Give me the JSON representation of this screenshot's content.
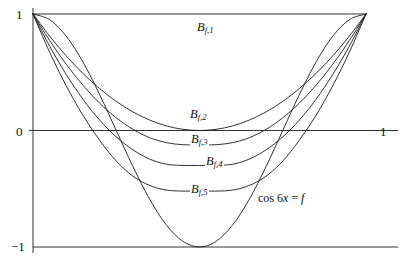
{
  "figure": {
    "kind": "bernstein-approximation-plot",
    "background_color": "#ffffff",
    "curve_color": "#1a1a1a",
    "axis_color": "#333333"
  },
  "axes": {
    "y_top_label": "1",
    "y_zero_label": "0",
    "y_bottom_label": "−1",
    "x_right_label": "1",
    "xlim": [
      0,
      1
    ],
    "ylim": [
      -1,
      1
    ],
    "grid": false,
    "ticks_y": [
      1,
      0,
      -1
    ],
    "ticks_x": [
      1
    ]
  },
  "labels": {
    "b1": {
      "base": "B",
      "sub": "f,1"
    },
    "b2": {
      "base": "B",
      "sub": "f,2"
    },
    "b3": {
      "base": "B",
      "sub": "f,3"
    },
    "b4": {
      "base": "B",
      "sub": "f,4"
    },
    "b5": {
      "base": "B",
      "sub": "f,5"
    },
    "fn_prefix": "cos 6",
    "fn_var": "x",
    "fn_eq": " = ",
    "fn_name": "f"
  },
  "chart_data": {
    "type": "line",
    "title": "",
    "xlabel": "",
    "ylabel": "",
    "xlim": [
      0,
      1
    ],
    "ylim": [
      -1,
      1
    ],
    "grid": false,
    "legend": "inline-annotations",
    "annotations": [
      {
        "text": "B_{f,1}",
        "x": 0.49,
        "y": 0.84
      },
      {
        "text": "B_{f,2}",
        "x": 0.5,
        "y": 0.08
      },
      {
        "text": "B_{f,3}",
        "x": 0.5,
        "y": -0.1
      },
      {
        "text": "B_{f,4}",
        "x": 0.545,
        "y": -0.29
      },
      {
        "text": "B_{f,5}",
        "x": 0.5,
        "y": -0.51
      },
      {
        "text": "cos 6x = f",
        "x": 0.73,
        "y": -0.62
      }
    ],
    "x": [
      0,
      0.05,
      0.1,
      0.15,
      0.2,
      0.25,
      0.3,
      0.35,
      0.4,
      0.45,
      0.5,
      0.55,
      0.6,
      0.65,
      0.7,
      0.75,
      0.8,
      0.85,
      0.9,
      0.95,
      1
    ],
    "series": [
      {
        "name": "cos 6x = f",
        "note": "target function f(t)=cos(2*pi*t) on [0,1]",
        "values": [
          1,
          0.951,
          0.809,
          0.588,
          0.309,
          0,
          -0.309,
          -0.588,
          -0.809,
          -0.951,
          -1,
          -0.951,
          -0.809,
          -0.588,
          -0.309,
          0,
          0.309,
          0.588,
          0.809,
          0.951,
          1
        ]
      },
      {
        "name": "B_{f,1}",
        "note": "degree-1 Bernstein polynomial: constant 1 chord",
        "values": [
          1,
          1,
          1,
          1,
          1,
          1,
          1,
          1,
          1,
          1,
          1,
          1,
          1,
          1,
          1,
          1,
          1,
          1,
          1,
          1,
          1
        ]
      },
      {
        "name": "B_{f,2}",
        "note": "degree-2 Bernstein polynomial, minimum ~0 at x=0.5",
        "values": [
          1,
          0.81,
          0.64,
          0.49,
          0.36,
          0.25,
          0.16,
          0.09,
          0.04,
          0.01,
          0,
          0.01,
          0.04,
          0.09,
          0.16,
          0.25,
          0.36,
          0.49,
          0.64,
          0.81,
          1
        ]
      },
      {
        "name": "B_{f,3}",
        "note": "degree-3 Bernstein polynomial, minimum ~-0.125 at x=0.5",
        "values": [
          1,
          0.772,
          0.568,
          0.389,
          0.235,
          0.109,
          0.01,
          -0.061,
          -0.104,
          -0.122,
          -0.125,
          -0.122,
          -0.104,
          -0.061,
          0.01,
          0.109,
          0.235,
          0.389,
          0.568,
          0.772,
          1
        ]
      },
      {
        "name": "B_{f,4}",
        "note": "degree-4 Bernstein polynomial, minimum ~-0.30 at x=0.5",
        "values": [
          1,
          0.724,
          0.48,
          0.268,
          0.09,
          -0.055,
          -0.166,
          -0.245,
          -0.289,
          -0.3,
          -0.3,
          -0.3,
          -0.289,
          -0.245,
          -0.166,
          -0.055,
          0.09,
          0.268,
          0.48,
          0.724,
          1
        ]
      },
      {
        "name": "B_{f,5}",
        "note": "degree-5 Bernstein polynomial, minimum ~-0.52 at x=0.5",
        "values": [
          1,
          0.672,
          0.383,
          0.131,
          -0.083,
          -0.262,
          -0.392,
          -0.471,
          -0.511,
          -0.52,
          -0.52,
          -0.52,
          -0.511,
          -0.471,
          -0.392,
          -0.262,
          -0.083,
          0.131,
          0.383,
          0.672,
          1
        ]
      }
    ]
  }
}
